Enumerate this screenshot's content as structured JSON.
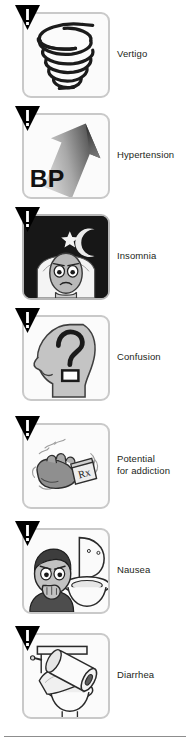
{
  "page": {
    "background_color": "#ffffff",
    "text_color": "#231f20",
    "divider_color": "#8d8d8d",
    "tile_border_color": "#c9c9c9",
    "warning_badge_color": "#000000"
  },
  "effects": [
    {
      "label": "Vertigo",
      "icon": "spiral-vertigo-icon",
      "badge": "warning-triangle-icon",
      "tile_style": "light"
    },
    {
      "label": "Hypertension",
      "icon": "bp-up-arrow-icon",
      "badge": "warning-triangle-icon",
      "tile_style": "light",
      "icon_text": "BP"
    },
    {
      "label": "Insomnia",
      "icon": "sleepless-face-moon-icon",
      "badge": "warning-triangle-icon",
      "tile_style": "dark"
    },
    {
      "label": "Confusion",
      "icon": "head-question-mark-icon",
      "badge": "warning-triangle-icon",
      "tile_style": "light",
      "icon_text": "?"
    },
    {
      "label": "Potential\nfor addiction",
      "icon": "shaking-hand-rx-bottle-icon",
      "badge": "warning-triangle-icon",
      "tile_style": "light",
      "icon_text": "Rx"
    },
    {
      "label": "Nausea",
      "icon": "person-vomiting-toilet-icon",
      "badge": "warning-triangle-icon",
      "tile_style": "light"
    },
    {
      "label": "Diarrhea",
      "icon": "toilet-paper-roll-icon",
      "badge": "warning-triangle-icon",
      "tile_style": "light"
    }
  ]
}
